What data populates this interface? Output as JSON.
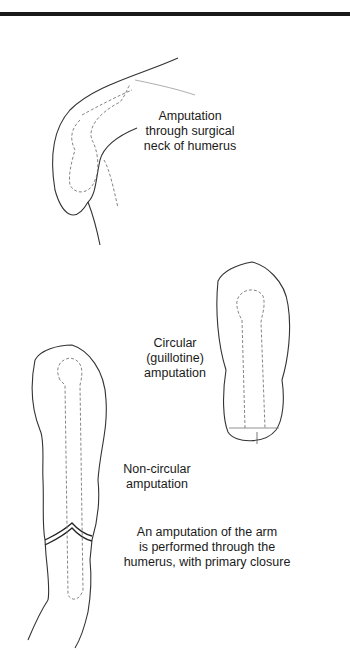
{
  "figure": {
    "type": "surgical-illustration",
    "labels": {
      "shoulder": [
        "Amputation",
        "through surgical",
        "neck of humerus"
      ],
      "circular": [
        "Circular",
        "(guillotine)",
        "amputation"
      ],
      "noncircular": [
        "Non-circular",
        "amputation"
      ],
      "description": [
        "An amputation of the arm",
        "is performed through the",
        "humerus, with primary closure"
      ]
    },
    "colors": {
      "line": "#333333",
      "dashed": "#777777",
      "text": "#1a1a1a",
      "background": "#ffffff",
      "top_rule": "#1a1a1a"
    }
  }
}
